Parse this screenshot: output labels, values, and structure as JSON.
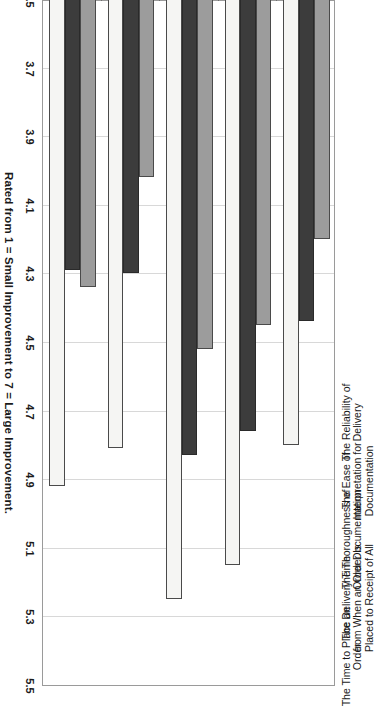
{
  "chart_data": {
    "type": "bar",
    "orientation": "horizontal-grouped",
    "title": "",
    "xlabel": "Rated from 1 = Small Improvement to 7 = Large Improvement.",
    "ylabel": "",
    "axis_title": "Rated from 1 = Small Improvement to 7 = Large Improvement.",
    "xlim": [
      3.5,
      5.5
    ],
    "tick_labels": [
      "5.5",
      "5.3",
      "5.1",
      "4.9",
      "4.7",
      "4.5",
      "4.3",
      "4.1",
      "3.9",
      "3.7",
      "3.5"
    ],
    "tick_values": [
      5.5,
      5.3,
      5.1,
      4.9,
      4.7,
      4.5,
      4.3,
      4.1,
      3.9,
      3.7,
      3.5
    ],
    "grid": true,
    "legend": "none",
    "baseline": 3.5,
    "categories": [
      [
        "The Time to Place an",
        "Order"
      ],
      [
        "The Delivery Time",
        "from When an Order Is",
        "Placed to Receipt of All"
      ],
      [
        "The Thoroughness of",
        "Order Documentation"
      ],
      [
        "The Ease of",
        "Interpretation for",
        "Documentation"
      ],
      [
        "The Reliability of",
        "Delivery"
      ]
    ],
    "categories_flat": [
      "The Time to Place an Order",
      "The Delivery Time from When an Order Is Placed to Receipt of All",
      "The Thoroughness of Order Documentation",
      "The Ease of Interpretation for Documentation",
      "The Reliability of Delivery"
    ],
    "series": [
      {
        "name": "Series 1",
        "color": "#f5f5f3",
        "values": [
          4.92,
          4.81,
          5.25,
          5.15,
          4.8
        ]
      },
      {
        "name": "Series 2",
        "color": "#3c3c3c",
        "values": [
          4.29,
          4.3,
          4.83,
          4.76,
          4.44
        ]
      },
      {
        "name": "Series 3",
        "color": "#9c9c9c",
        "values": [
          4.34,
          4.02,
          4.52,
          4.45,
          4.2
        ]
      }
    ],
    "colors": {
      "series_1": "#f5f5f3",
      "series_2": "#3c3c3c",
      "series_3": "#9c9c9c",
      "gridline": "#d8d8d8",
      "axis": "#6e6e6e",
      "text": "#1a1a1a",
      "background": "#ffffff"
    }
  }
}
